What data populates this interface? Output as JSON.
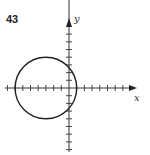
{
  "problem_number": "43",
  "axes": {
    "x_label": "x",
    "y_label": "y",
    "origin_px": [
      69,
      88
    ],
    "tick_spacing_px": 7.7,
    "x_ticks_units": [
      -8,
      -7,
      -6,
      -5,
      -4,
      -3,
      -2,
      -1,
      1,
      2,
      3,
      4,
      5,
      6,
      7,
      8
    ],
    "y_ticks_units": [
      -8,
      -7,
      -6,
      -5,
      -4,
      -3,
      -2,
      -1,
      1,
      2,
      3,
      4,
      5,
      6,
      7,
      8,
      9
    ]
  },
  "circle": {
    "center_units": [
      -3,
      0
    ],
    "radius_units": 4,
    "stroke": "#222222"
  },
  "colors": {
    "ink": "#222222",
    "background": "#ffffff"
  }
}
